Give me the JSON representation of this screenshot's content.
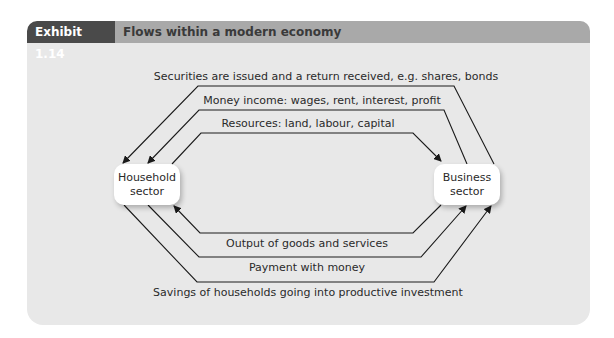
{
  "exhibit": {
    "number_label": "Exhibit 1.14",
    "title": "Flows within a modern economy"
  },
  "sectors": {
    "household": {
      "line1": "Household",
      "line2": "sector"
    },
    "business": {
      "line1": "Business",
      "line2": "sector"
    }
  },
  "flows": {
    "securities": "Securities are issued and a return received, e.g. shares, bonds",
    "money_income": "Money income: wages, rent, interest, profit",
    "resources": "Resources: land, labour, capital",
    "output": "Output of goods and services",
    "payment": "Payment with money",
    "savings": "Savings of households going into productive investment"
  },
  "colors": {
    "panel_bg": "#e8e8e8",
    "header_bg": "#a9a9a9",
    "label_bg": "#4a4a4a",
    "line": "#1a1a1a"
  }
}
